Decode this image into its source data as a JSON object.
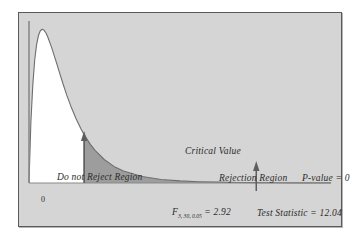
{
  "chart_data": {
    "type": "area",
    "title": "",
    "xlabel": "",
    "ylabel": "",
    "distribution": "F",
    "df_numerator": 3,
    "df_denominator": 30,
    "alpha": 0.05,
    "critical_value": 2.92,
    "test_statistic": 12.04,
    "p_value": 0,
    "xlim": [
      0,
      16
    ],
    "ylim": [
      0,
      0.78
    ],
    "grid": false,
    "legend": false,
    "origin_tick": "0",
    "curve_points": [
      {
        "x": 0.0,
        "y": 0.0
      },
      {
        "x": 0.1,
        "y": 0.295
      },
      {
        "x": 0.2,
        "y": 0.47
      },
      {
        "x": 0.3,
        "y": 0.59
      },
      {
        "x": 0.4,
        "y": 0.665
      },
      {
        "x": 0.5,
        "y": 0.71
      },
      {
        "x": 0.6,
        "y": 0.733
      },
      {
        "x": 0.7,
        "y": 0.74
      },
      {
        "x": 0.8,
        "y": 0.735
      },
      {
        "x": 0.9,
        "y": 0.722
      },
      {
        "x": 1.0,
        "y": 0.702
      },
      {
        "x": 1.2,
        "y": 0.652
      },
      {
        "x": 1.4,
        "y": 0.595
      },
      {
        "x": 1.6,
        "y": 0.536
      },
      {
        "x": 1.8,
        "y": 0.478
      },
      {
        "x": 2.0,
        "y": 0.423
      },
      {
        "x": 2.25,
        "y": 0.362
      },
      {
        "x": 2.5,
        "y": 0.308
      },
      {
        "x": 2.75,
        "y": 0.261
      },
      {
        "x": 2.92,
        "y": 0.233
      },
      {
        "x": 3.25,
        "y": 0.186
      },
      {
        "x": 3.5,
        "y": 0.157
      },
      {
        "x": 4.0,
        "y": 0.112
      },
      {
        "x": 4.5,
        "y": 0.08
      },
      {
        "x": 5.0,
        "y": 0.058
      },
      {
        "x": 6.0,
        "y": 0.031
      },
      {
        "x": 7.0,
        "y": 0.017
      },
      {
        "x": 8.0,
        "y": 0.01
      },
      {
        "x": 9.0,
        "y": 0.006
      },
      {
        "x": 10.0,
        "y": 0.004
      },
      {
        "x": 11.0,
        "y": 0.0025
      },
      {
        "x": 12.04,
        "y": 0.0016
      },
      {
        "x": 13.0,
        "y": 0.0011
      },
      {
        "x": 14.0,
        "y": 0.0008
      },
      {
        "x": 15.0,
        "y": 0.0005
      },
      {
        "x": 16.0,
        "y": 0.0004
      }
    ],
    "regions": [
      {
        "name": "Do not Reject Region",
        "from": 0,
        "to": 2.92,
        "fill": "#ffffff"
      },
      {
        "name": "Rejection Region",
        "from": 2.92,
        "to": 16,
        "fill": "#9d9d9d"
      }
    ],
    "annotations": [
      {
        "name": "critical-value",
        "label": "Critical Value",
        "x": 2.92,
        "marker": "arrow-up"
      },
      {
        "name": "test-statistic",
        "label": "Test Statistic = 12.04",
        "x": 12.04,
        "marker": "arrow-up"
      },
      {
        "name": "p-value",
        "label": "P-value = 0",
        "x": 12.04
      }
    ]
  },
  "labels": {
    "do_not_reject_region": "Do not Reject Region",
    "rejection_region": "Rejection Region",
    "critical_value": "Critical Value",
    "p_value": "P-value = 0",
    "test_statistic": "Test Statistic = 12.04",
    "f_critical_symbol": "F",
    "f_critical_subscript": "3, 30, 0.05",
    "f_critical_equals": " = 2.92",
    "origin": "0"
  },
  "colors": {
    "panel_background": "#d5d5d5",
    "panel_border": "#5a5a5a",
    "page_background": "#ffffff",
    "curve_line": "#6e6e6e",
    "axis_line": "#8a8a8a",
    "accept_fill": "#ffffff",
    "reject_fill": "#9d9d9d",
    "text": "#2b2b2b"
  }
}
